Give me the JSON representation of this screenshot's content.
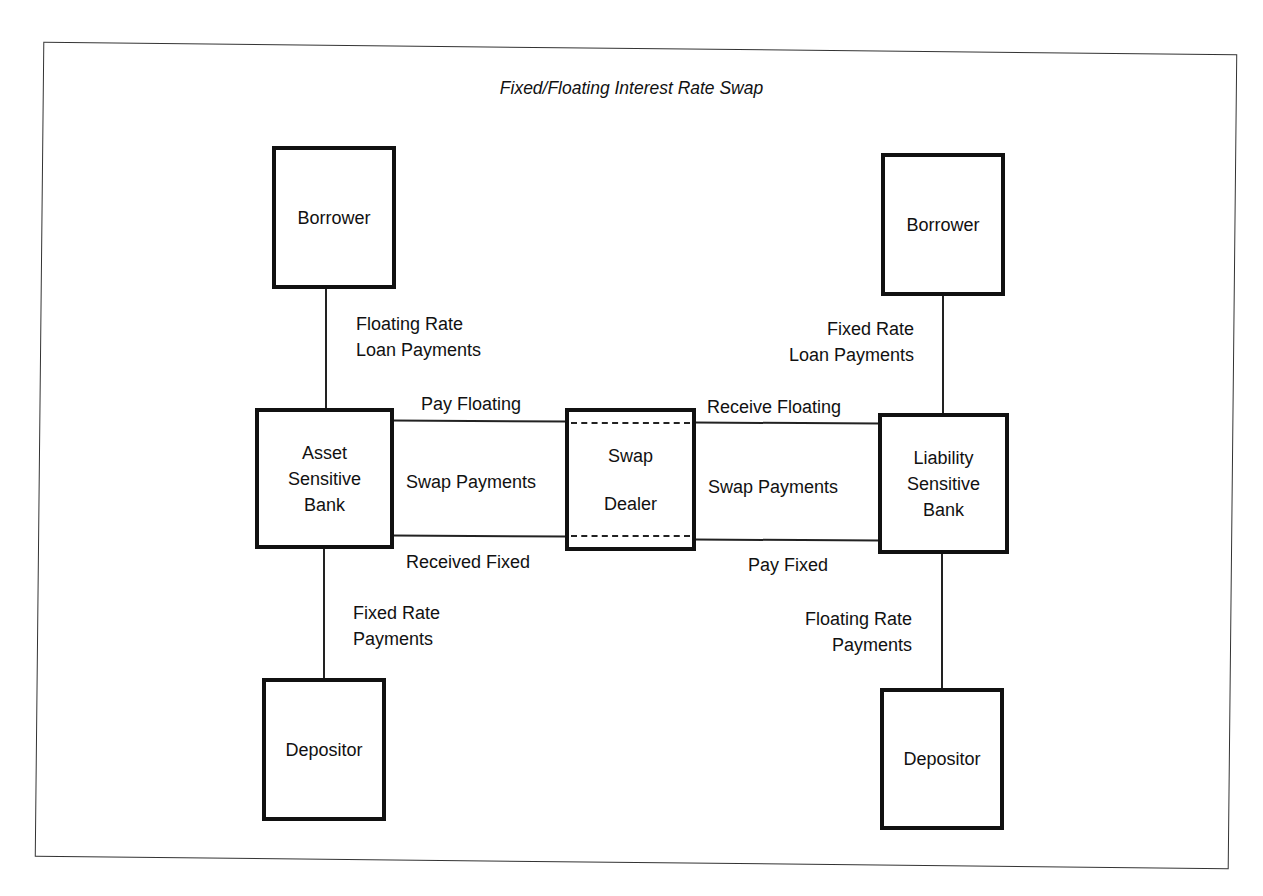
{
  "title": "Fixed/Floating Interest Rate Swap",
  "nodes": {
    "left_borrower": "Borrower",
    "asset_bank": {
      "line1": "Asset",
      "line2": "Sensitive",
      "line3": "Bank"
    },
    "left_depositor": "Depositor",
    "swap_dealer": {
      "line1": "Swap",
      "line2": "Dealer"
    },
    "right_borrower": "Borrower",
    "liability_bank": {
      "line1": "Liability",
      "line2": "Sensitive",
      "line3": "Bank"
    },
    "right_depositor": "Depositor"
  },
  "edges": {
    "left_borrower_to_bank": {
      "line1": "Floating Rate",
      "line2": "Loan Payments"
    },
    "left_bank_to_depositor": {
      "line1": "Fixed Rate",
      "line2": "Payments"
    },
    "right_borrower_to_bank": {
      "line1": "Fixed Rate",
      "line2": "Loan Payments"
    },
    "right_bank_to_depositor": {
      "line1": "Floating Rate",
      "line2": "Payments"
    },
    "asset_dealer_top": "Pay Floating",
    "asset_dealer_middle": "Swap Payments",
    "asset_dealer_bottom": "Received Fixed",
    "dealer_liability_top": "Receive Floating",
    "dealer_liability_middle": "Swap Payments",
    "dealer_liability_bottom": "Pay Fixed"
  }
}
